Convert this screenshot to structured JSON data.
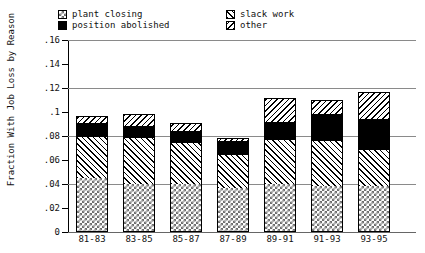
{
  "chart_data": {
    "type": "bar",
    "stacked": true,
    "title": "",
    "xlabel": "",
    "ylabel": "Fraction With Job Loss by Reason",
    "categories": [
      "81-83",
      "83-85",
      "85-87",
      "87-89",
      "89-91",
      "91-93",
      "93-95"
    ],
    "series": [
      {
        "name": "plant closing",
        "pattern": "checkerboard",
        "values": [
          0.045,
          0.04,
          0.04,
          0.037,
          0.04,
          0.038,
          0.038
        ]
      },
      {
        "name": "slack work",
        "pattern": "diagonal-hatch",
        "values": [
          0.034,
          0.038,
          0.034,
          0.027,
          0.037,
          0.038,
          0.03
        ]
      },
      {
        "name": "position abolished",
        "pattern": "solid-black",
        "values": [
          0.012,
          0.01,
          0.01,
          0.012,
          0.015,
          0.022,
          0.026
        ]
      },
      {
        "name": "other",
        "pattern": "back-diagonal-hatch",
        "values": [
          0.006,
          0.01,
          0.007,
          0.002,
          0.02,
          0.012,
          0.023
        ]
      }
    ],
    "totals": [
      0.122,
      0.098,
      0.091,
      0.078,
      0.112,
      0.11,
      0.117
    ],
    "ylim": [
      0,
      0.16
    ],
    "ytick_values": [
      0,
      0.02,
      0.04,
      0.06,
      0.08,
      0.1,
      0.12,
      0.14,
      0.16
    ],
    "ytick_labels": [
      "0",
      ".02",
      ".04",
      ".06",
      ".08",
      ".1",
      ".12",
      ".14",
      ".16"
    ],
    "gridlines": [
      0.04,
      0.08,
      0.12,
      0.16
    ],
    "grid": true,
    "legend_position": "top",
    "legend_order": [
      "plant closing",
      "slack work",
      "position abolished",
      "other"
    ]
  },
  "legend": {
    "items": [
      {
        "label": "plant closing",
        "column": 1,
        "row": 1
      },
      {
        "label": "position abolished",
        "column": 1,
        "row": 2
      },
      {
        "label": "slack work",
        "column": 2,
        "row": 1
      },
      {
        "label": "other",
        "column": 2,
        "row": 2
      }
    ]
  },
  "colors": {
    "ink": "#000000",
    "grid": "#8a8a8a",
    "hatch": "#000000",
    "checker": "#6f6f6f",
    "background": "#ffffff"
  }
}
